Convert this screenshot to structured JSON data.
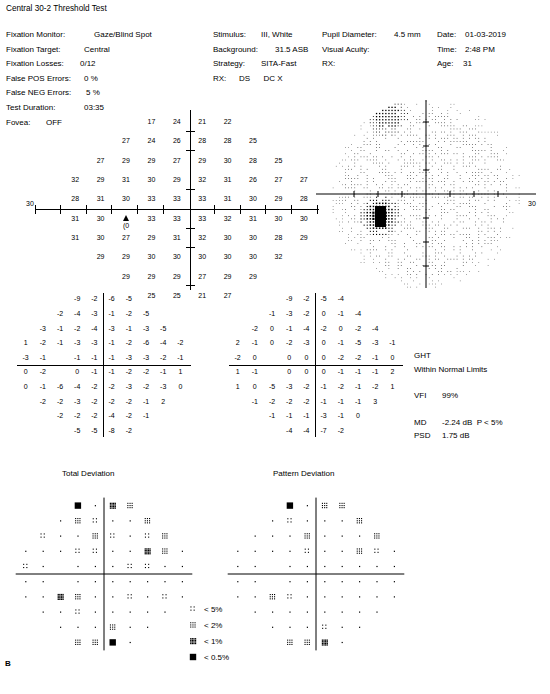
{
  "report": {
    "title": "Central 30-2 Threshold Test",
    "panel_label": "B"
  },
  "params_left": [
    {
      "label": "Fixation Monitor:",
      "value": "Gaze/Blind Spot"
    },
    {
      "label": "Fixation Target:",
      "value": "Central"
    },
    {
      "label": "Fixation Losses:",
      "value": "0/12"
    },
    {
      "label": "False POS Errors:",
      "value": "0 %"
    },
    {
      "label": "False NEG Errors:",
      "value": "5 %"
    },
    {
      "label": "Test Duration:",
      "value": "03:35"
    },
    {
      "label": "Fovea:",
      "value": "OFF"
    }
  ],
  "params_mid": [
    {
      "label": "Stimulus:",
      "value": "III, White"
    },
    {
      "label": "Background:",
      "value": "31.5 ASB"
    },
    {
      "label": "Strategy:",
      "value": "SITA-Fast"
    },
    {
      "label": "RX:",
      "value": "DS      DC X"
    }
  ],
  "params_right_a": [
    {
      "label": "Pupil Diameter:",
      "value": "4.5 mm"
    },
    {
      "label": "Visual Acuity:",
      "value": ""
    },
    {
      "label": "RX:",
      "value": ""
    }
  ],
  "params_right_b": [
    {
      "label": "Date:",
      "value": "01-03-2019"
    },
    {
      "label": "Time:",
      "value": "2:48 PM"
    },
    {
      "label": "Age:",
      "value": "31"
    }
  ],
  "chart_data": {
    "type": "table",
    "title": "Central 30-2 Threshold Test",
    "xlabel": "",
    "ylabel": "",
    "threshold_units": "dB",
    "threshold_grid": [
      [
        null,
        null,
        null,
        17,
        24,
        21,
        22,
        null,
        null,
        null
      ],
      [
        null,
        null,
        27,
        24,
        26,
        28,
        28,
        25,
        null,
        null
      ],
      [
        null,
        27,
        29,
        29,
        27,
        29,
        30,
        28,
        25,
        null
      ],
      [
        32,
        29,
        31,
        30,
        29,
        32,
        31,
        26,
        27,
        27
      ],
      [
        28,
        31,
        30,
        33,
        33,
        33,
        31,
        30,
        29,
        28
      ],
      [
        31,
        30,
        10,
        33,
        33,
        33,
        32,
        31,
        30,
        30
      ],
      [
        31,
        30,
        27,
        29,
        31,
        32,
        30,
        30,
        28,
        29
      ],
      [
        null,
        29,
        29,
        30,
        30,
        30,
        30,
        30,
        32,
        null
      ],
      [
        null,
        null,
        29,
        29,
        29,
        27,
        29,
        29,
        null,
        null
      ],
      [
        null,
        null,
        null,
        25,
        25,
        21,
        27,
        null,
        null,
        null
      ]
    ],
    "blind_spot_marker": {
      "row": 5,
      "col": 2,
      "symbol": "triangle",
      "value": "(0"
    },
    "axis_scale_label": "30",
    "total_deviation": [
      [
        null,
        null,
        null,
        -9,
        -2,
        -6,
        -5,
        null,
        null,
        null
      ],
      [
        null,
        null,
        -2,
        -4,
        -3,
        -1,
        -2,
        -5,
        null,
        null
      ],
      [
        null,
        -3,
        -1,
        -2,
        -4,
        -3,
        -1,
        -3,
        -5,
        null
      ],
      [
        1,
        -2,
        -1,
        -3,
        -3,
        -1,
        -2,
        -6,
        -4,
        -2
      ],
      [
        -3,
        -1,
        null,
        -1,
        -1,
        -1,
        -3,
        -3,
        -2,
        -1
      ],
      [
        0,
        -2,
        null,
        0,
        -1,
        -1,
        -2,
        -2,
        -1,
        1
      ],
      [
        0,
        -1,
        -6,
        -4,
        -2,
        -2,
        -3,
        -2,
        -3,
        0
      ],
      [
        null,
        -2,
        -2,
        -3,
        -2,
        -2,
        -2,
        -1,
        2,
        null
      ],
      [
        null,
        null,
        -2,
        -2,
        -2,
        -4,
        -2,
        -1,
        null,
        null
      ],
      [
        null,
        null,
        null,
        -5,
        -5,
        -8,
        -2,
        null,
        null,
        null
      ]
    ],
    "pattern_deviation": [
      [
        null,
        null,
        null,
        -9,
        -2,
        -5,
        -4,
        null,
        null,
        null
      ],
      [
        null,
        null,
        -1,
        -3,
        -2,
        0,
        -1,
        -4,
        null,
        null
      ],
      [
        null,
        -2,
        0,
        -1,
        -4,
        -2,
        0,
        -2,
        -4,
        null
      ],
      [
        2,
        -1,
        0,
        -2,
        -3,
        0,
        -1,
        -5,
        -3,
        -1
      ],
      [
        -2,
        0,
        null,
        0,
        0,
        0,
        -2,
        -2,
        -1,
        0
      ],
      [
        1,
        -1,
        null,
        0,
        0,
        0,
        -1,
        -1,
        -1,
        2
      ],
      [
        1,
        0,
        -5,
        -3,
        -2,
        -1,
        -2,
        -1,
        -2,
        1
      ],
      [
        null,
        -1,
        -2,
        -2,
        -2,
        -1,
        -1,
        -1,
        3,
        null
      ],
      [
        null,
        null,
        -1,
        -1,
        -1,
        -3,
        -1,
        0,
        null,
        null
      ],
      [
        null,
        null,
        null,
        -4,
        -4,
        -7,
        -2,
        null,
        null,
        null
      ]
    ]
  },
  "sections": {
    "total_deviation_label": "Total Deviation",
    "pattern_deviation_label": "Pattern Deviation"
  },
  "stats": {
    "ght_label": "GHT",
    "ght_value": "Within Normal Limits",
    "vfi_label": "VFI",
    "vfi_value": "99%",
    "md_label": "MD",
    "md_value": "-2.24 dB  P < 5%",
    "psd_label": "PSD",
    "psd_value": "1.75 dB"
  },
  "legend": [
    {
      "symbol": "p5",
      "label": "< 5%"
    },
    {
      "symbol": "p2",
      "label": "< 2%"
    },
    {
      "symbol": "p1",
      "label": "< 1%"
    },
    {
      "symbol": "p05",
      "label": "< 0.5%"
    }
  ],
  "colors": {
    "ink": "#000000",
    "paper": "#ffffff"
  }
}
